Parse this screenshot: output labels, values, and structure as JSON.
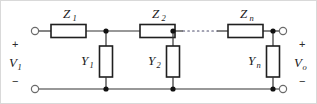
{
  "figure": {
    "background_color": "#ffffff",
    "line_color": "#333333",
    "border_color": "#d9d9d9"
  },
  "ports": {
    "input": {
      "voltage_label": "V",
      "voltage_subscript": "1",
      "plus": "+",
      "minus": "−"
    },
    "output": {
      "voltage_label": "V",
      "voltage_subscript": "o",
      "plus": "+",
      "minus": "−"
    }
  },
  "series_elements": [
    {
      "symbol": "Z",
      "subscript": "1",
      "label": "Z1"
    },
    {
      "symbol": "Z",
      "subscript": "2",
      "label": "Z2"
    },
    {
      "symbol": "Z",
      "subscript": "n",
      "label": "Zn"
    }
  ],
  "shunt_elements": [
    {
      "symbol": "Y",
      "subscript": "1",
      "label": "Y1"
    },
    {
      "symbol": "Y",
      "subscript": "2",
      "label": "Y2"
    },
    {
      "symbol": "Y",
      "subscript": "n",
      "label": "Yn"
    }
  ],
  "continuation": {
    "style": "dotted",
    "meaning": "repeated ladder sections"
  },
  "icons": {
    "terminal": "open-circle-terminal",
    "node": "junction-dot"
  }
}
